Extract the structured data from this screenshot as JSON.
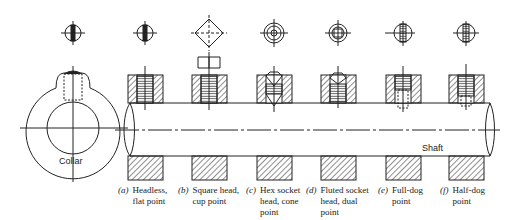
{
  "figure": {
    "labels": {
      "collar": "Collar",
      "shaft": "Shaft"
    },
    "screws": [
      {
        "id": "a",
        "letter": "(a)",
        "line1": "Headless,",
        "line2": "flat point",
        "line3": "",
        "x": 145
      },
      {
        "id": "b",
        "letter": "(b)",
        "line1": "Square head,",
        "line2": "cup point",
        "line3": "",
        "x": 209
      },
      {
        "id": "c",
        "letter": "(c)",
        "line1": "Hex socket",
        "line2": "head, cone",
        "line3": "point",
        "x": 274
      },
      {
        "id": "d",
        "letter": "(d)",
        "line1": "Fluted socket",
        "line2": "head, dual",
        "line3": "point",
        "x": 338
      },
      {
        "id": "e",
        "letter": "(e)",
        "line1": "Full-dog",
        "line2": "point",
        "line3": "",
        "x": 403
      },
      {
        "id": "f",
        "letter": "(f)",
        "line1": "Half-dog",
        "line2": "point",
        "line3": "",
        "x": 466
      }
    ],
    "colors": {
      "line": "#222222",
      "background": "#ffffff"
    }
  }
}
